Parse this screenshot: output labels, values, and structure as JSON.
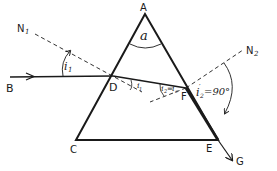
{
  "diagram": {
    "points": {
      "A": "A",
      "B": "B",
      "C": "C",
      "D": "D",
      "E": "E",
      "F": "F",
      "G": "G",
      "N1": "N",
      "N1_sub": "1",
      "N2": "N",
      "N2_sub": "2"
    },
    "angles": {
      "apex": "a",
      "incidence": "i",
      "incidence_sub": "1",
      "refraction_first": "i",
      "refraction_first_sub": "1",
      "refraction_first_prime": "′",
      "second_incidence": "i",
      "second_incidence_sub": "2",
      "second_incidence_eq": "=",
      "critical": "i",
      "critical_sub": "c",
      "emergence": "i",
      "emergence_sub": "2",
      "emergence_prime": "′",
      "emergence_value": "=90°"
    },
    "colors": {
      "line": "#1a1a1a",
      "background": "#ffffff"
    }
  }
}
